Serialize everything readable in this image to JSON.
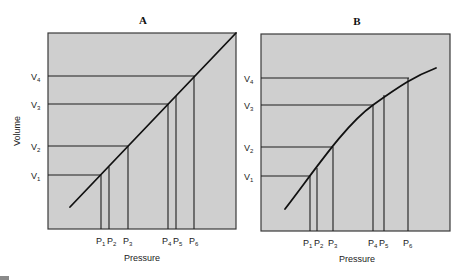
{
  "panels": [
    {
      "id": "A",
      "title": "A",
      "xlabel": "Pressure",
      "ylabel": "Volume",
      "relationship": "linear",
      "v_labels": [
        {
          "main": "V",
          "sub": "1"
        },
        {
          "main": "V",
          "sub": "2"
        },
        {
          "main": "V",
          "sub": "3"
        },
        {
          "main": "V",
          "sub": "4"
        }
      ],
      "p_labels": [
        {
          "main": "P",
          "sub": "1"
        },
        {
          "main": "P",
          "sub": "2"
        },
        {
          "main": "P",
          "sub": "3"
        },
        {
          "main": "P",
          "sub": "4"
        },
        {
          "main": "P",
          "sub": "5"
        },
        {
          "main": "P",
          "sub": "6"
        }
      ]
    },
    {
      "id": "B",
      "title": "B",
      "xlabel": "Pressure",
      "ylabel": "",
      "relationship": "concave-down curve",
      "v_labels": [
        {
          "main": "V",
          "sub": "1"
        },
        {
          "main": "V",
          "sub": "2"
        },
        {
          "main": "V",
          "sub": "3"
        },
        {
          "main": "V",
          "sub": "4"
        }
      ],
      "p_labels": [
        {
          "main": "P",
          "sub": "1"
        },
        {
          "main": "P",
          "sub": "2"
        },
        {
          "main": "P",
          "sub": "3"
        },
        {
          "main": "P",
          "sub": "4"
        },
        {
          "main": "P",
          "sub": "5"
        },
        {
          "main": "P",
          "sub": "6"
        }
      ]
    }
  ],
  "colors": {
    "panel_fill": "#cfcfcf",
    "line": "#111111"
  }
}
